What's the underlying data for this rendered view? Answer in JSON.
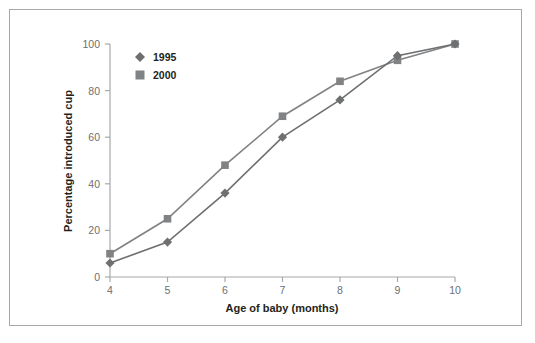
{
  "figure": {
    "border_color": "#a6a8ab",
    "background": "#ffffff"
  },
  "chart_data": {
    "type": "line",
    "title": "",
    "xlabel": "Age of baby (months)",
    "ylabel": "Percentage introduced cup",
    "x": [
      4,
      5,
      6,
      7,
      8,
      9,
      10
    ],
    "xtick_labels": [
      "4",
      "5",
      "6",
      "7",
      "8",
      "9",
      "10"
    ],
    "ytick_labels": [
      "0",
      "20",
      "40",
      "60",
      "80",
      "100"
    ],
    "yticks": [
      0,
      20,
      40,
      60,
      80,
      100
    ],
    "xlim": [
      4,
      10
    ],
    "ylim": [
      0,
      100
    ],
    "grid": false,
    "legend_position": "top-left-inside",
    "series": [
      {
        "name": "1995",
        "marker": "diamond",
        "color": "#6d6f71",
        "values": [
          6,
          15,
          36,
          60,
          76,
          95,
          100
        ]
      },
      {
        "name": "2000",
        "marker": "square",
        "color": "#808284",
        "values": [
          10,
          25,
          48,
          69,
          84,
          93,
          100
        ]
      }
    ]
  }
}
